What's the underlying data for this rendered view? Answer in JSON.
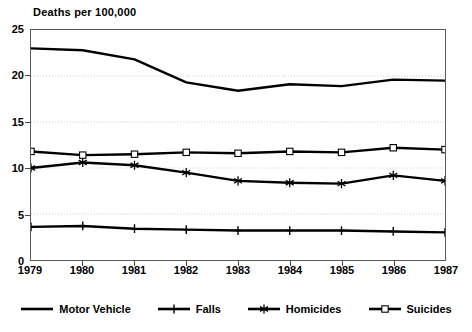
{
  "chart_data": {
    "type": "line",
    "title": "Deaths per 100,000",
    "xlabel": "",
    "ylabel": "Deaths per 100,000",
    "grid": true,
    "legend_position": "bottom",
    "x": [
      1979,
      1980,
      1981,
      1982,
      1983,
      1984,
      1985,
      1986,
      1987
    ],
    "categories": [
      "1979",
      "1980",
      "1981",
      "1982",
      "1983",
      "1984",
      "1985",
      "1986",
      "1987"
    ],
    "xlim": [
      1979,
      1987
    ],
    "ylim": [
      0,
      25
    ],
    "yticks": [
      0,
      5,
      10,
      15,
      20,
      25
    ],
    "ytick_labels": [
      "0",
      "5",
      "10",
      "15",
      "20",
      "25"
    ],
    "series": [
      {
        "name": "Motor Vehicle",
        "marker": "none",
        "color": "#000000",
        "values": [
          23.0,
          22.8,
          21.8,
          19.3,
          18.4,
          19.1,
          18.9,
          19.6,
          19.5
        ]
      },
      {
        "name": "Falls",
        "marker": "plus",
        "color": "#000000",
        "values": [
          3.6,
          3.7,
          3.4,
          3.3,
          3.2,
          3.2,
          3.2,
          3.1,
          3.0
        ]
      },
      {
        "name": "Homicides",
        "marker": "star",
        "color": "#000000",
        "values": [
          10.0,
          10.6,
          10.3,
          9.5,
          8.6,
          8.4,
          8.3,
          9.2,
          8.6
        ]
      },
      {
        "name": "Suicides",
        "marker": "square",
        "color": "#000000",
        "values": [
          11.8,
          11.4,
          11.5,
          11.7,
          11.6,
          11.8,
          11.7,
          12.2,
          12.0
        ]
      }
    ]
  },
  "legend": {
    "items": [
      {
        "label": "Motor Vehicle"
      },
      {
        "label": "Falls"
      },
      {
        "label": "Homicides"
      },
      {
        "label": "Suicides"
      }
    ]
  },
  "colors": {
    "ink": "#000000",
    "frame": "#5a5a5a",
    "gridline": "#c8c8c8",
    "background": "#ffffff"
  }
}
